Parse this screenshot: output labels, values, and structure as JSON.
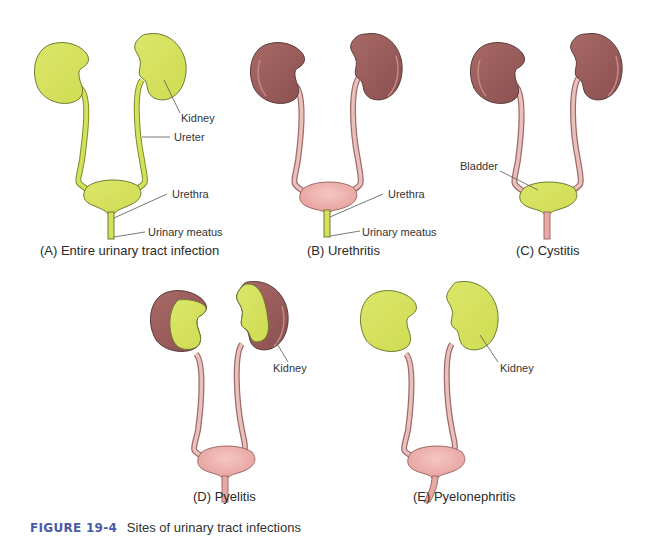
{
  "colors": {
    "infected": "#d4e15a",
    "kidney": "#9a5b5b",
    "kidney_highlight": "#c58a84",
    "tract": "#e8a9a5",
    "tract_dark": "#b56f6f",
    "outline": "#5a3b3b",
    "figure_number": "#4a5aa8"
  },
  "panels": [
    {
      "id": "A",
      "caption": "(A) Entire urinary tract infection",
      "labels": [
        "Kidney",
        "Ureter",
        "Urethra",
        "Urinary meatus"
      ],
      "infected_parts": [
        "kidneys",
        "ureters",
        "bladder",
        "urethra"
      ]
    },
    {
      "id": "B",
      "caption": "(B) Urethritis",
      "labels": [
        "Urethra",
        "Urinary meatus"
      ],
      "infected_parts": [
        "urethra"
      ]
    },
    {
      "id": "C",
      "caption": "(C) Cystitis",
      "labels": [
        "Bladder"
      ],
      "infected_parts": [
        "bladder"
      ]
    },
    {
      "id": "D",
      "caption": "(D) Pyelitis",
      "labels": [
        "Kidney"
      ],
      "infected_parts": [
        "renal pelvis"
      ]
    },
    {
      "id": "E",
      "caption": "(E) Pyelonephritis",
      "labels": [
        "Kidney"
      ],
      "infected_parts": [
        "kidneys"
      ]
    }
  ],
  "figure": {
    "number": "FIGURE 19-4",
    "title": "Sites of urinary tract infections"
  }
}
